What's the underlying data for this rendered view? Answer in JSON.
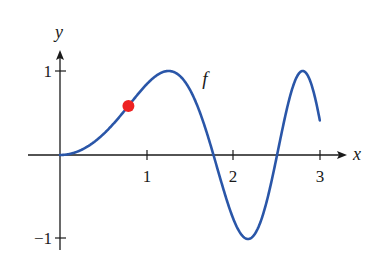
{
  "chart_data": {
    "type": "line",
    "title": "",
    "xlabel": "x",
    "ylabel": "y",
    "xlim": [
      0,
      3
    ],
    "ylim": [
      -1,
      1
    ],
    "x_ticks": [
      1,
      2,
      3
    ],
    "x_tick_labels": [
      "1",
      "2",
      "3"
    ],
    "y_ticks": [
      1,
      -1
    ],
    "y_tick_labels": [
      "1",
      "−1"
    ],
    "grid": false,
    "series": [
      {
        "name": "f",
        "label": "f",
        "color": "#2a56a8",
        "x": [
          0,
          0.25,
          0.5,
          0.75,
          1.0,
          1.25,
          1.5,
          1.77,
          2.0,
          2.17,
          2.3,
          2.51,
          2.65,
          2.8,
          2.9,
          3.0
        ],
        "y": [
          0,
          0.06,
          0.25,
          0.53,
          0.84,
          1.0,
          0.78,
          0.0,
          -0.76,
          -1.0,
          -0.84,
          0.0,
          0.67,
          1.0,
          0.86,
          0.41
        ]
      }
    ],
    "highlighted_point": {
      "x": 0.79,
      "y": 0.58,
      "color": "#ee2222"
    },
    "annotations": [
      {
        "text": "f",
        "x": 1.65,
        "y": 0.88
      }
    ]
  },
  "labels": {
    "x_axis": "x",
    "y_axis": "y",
    "curve": "f",
    "tick_x1": "1",
    "tick_x2": "2",
    "tick_x3": "3",
    "tick_y1": "1",
    "tick_yneg1": "−1"
  }
}
